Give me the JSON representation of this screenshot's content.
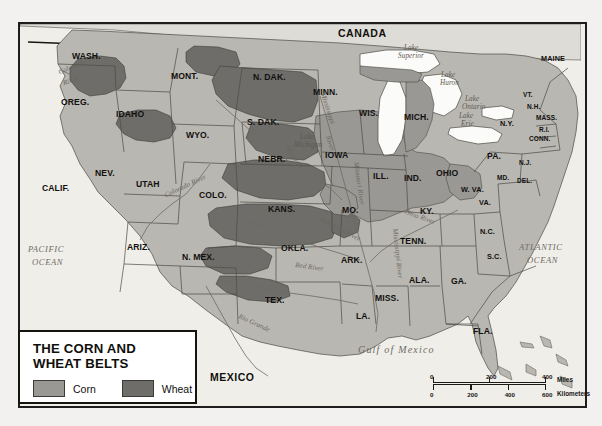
{
  "legend": {
    "title_line1": "THE CORN AND",
    "title_line2": "WHEAT BELTS",
    "corn_label": "Corn",
    "wheat_label": "Wheat",
    "corn_color": "#9a9894",
    "wheat_color": "#6e6d6a"
  },
  "scale": {
    "miles_unit": "Miles",
    "km_unit": "Kilometers",
    "miles_ticks": [
      "0",
      "200",
      "400"
    ],
    "km_ticks": [
      "0",
      "200",
      "400",
      "600"
    ]
  },
  "countries": [
    {
      "name": "CANADA",
      "x": 338,
      "y": 28
    },
    {
      "name": "MEXICO",
      "x": 210,
      "y": 372
    }
  ],
  "oceans": [
    {
      "name": "PACIFIC",
      "x": 28,
      "y": 245,
      "size": "sm"
    },
    {
      "name": "OCEAN",
      "x": 32,
      "y": 258,
      "size": "sm"
    },
    {
      "name": "ATLANTIC",
      "x": 519,
      "y": 243,
      "size": "sm"
    },
    {
      "name": "OCEAN",
      "x": 527,
      "y": 256,
      "size": "sm"
    },
    {
      "name": "Gulf of Mexico",
      "x": 358,
      "y": 345,
      "size": "gulf"
    }
  ],
  "lakes": [
    {
      "name": "Lake",
      "x": 404,
      "y": 45
    },
    {
      "name": "Superior",
      "x": 398,
      "y": 53
    },
    {
      "name": "Lake",
      "x": 441,
      "y": 72
    },
    {
      "name": "Huron",
      "x": 440,
      "y": 80
    },
    {
      "name": "Lake",
      "x": 300,
      "y": 134
    },
    {
      "name": "Michigan",
      "x": 294,
      "y": 142
    },
    {
      "name": "Lake",
      "x": 459,
      "y": 113
    },
    {
      "name": "Erie",
      "x": 461,
      "y": 121
    },
    {
      "name": "Lake",
      "x": 465,
      "y": 96
    },
    {
      "name": "Ontario",
      "x": 462,
      "y": 104
    }
  ],
  "rivers": [
    {
      "name": "Columbia",
      "x": 58,
      "y": 64,
      "rot": -22
    },
    {
      "name": "River",
      "x": 63,
      "y": 78,
      "rot": -18
    },
    {
      "name": "Colorado River",
      "x": 163,
      "y": 183,
      "rot": -25
    },
    {
      "name": "Rio Grande",
      "x": 237,
      "y": 320,
      "rot": 25
    },
    {
      "name": "Mississippi",
      "x": 311,
      "y": 105,
      "rot": 72
    },
    {
      "name": "River",
      "x": 322,
      "y": 140,
      "rot": 72
    },
    {
      "name": "Missouri",
      "x": 281,
      "y": 154,
      "rot": 55
    },
    {
      "name": "Missouri River",
      "x": 337,
      "y": 180,
      "rot": 82
    },
    {
      "name": "Arkansas River",
      "x": 318,
      "y": 226,
      "rot": 28
    },
    {
      "name": "Red River",
      "x": 295,
      "y": 264,
      "rot": 8
    },
    {
      "name": "Mississippi River",
      "x": 372,
      "y": 250,
      "rot": 84
    },
    {
      "name": "Ohio River",
      "x": 404,
      "y": 214,
      "rot": 20
    }
  ],
  "states": [
    {
      "name": "WASH.",
      "x": 72,
      "y": 52,
      "size": ""
    },
    {
      "name": "OREG.",
      "x": 61,
      "y": 98,
      "size": ""
    },
    {
      "name": "IDAHO",
      "x": 116,
      "y": 110,
      "size": ""
    },
    {
      "name": "MONT.",
      "x": 171,
      "y": 72,
      "size": ""
    },
    {
      "name": "WYO.",
      "x": 186,
      "y": 131,
      "size": ""
    },
    {
      "name": "N. DAK.",
      "x": 253,
      "y": 73,
      "size": ""
    },
    {
      "name": "S. DAK.",
      "x": 247,
      "y": 118,
      "size": ""
    },
    {
      "name": "NEBR.",
      "x": 258,
      "y": 155,
      "size": ""
    },
    {
      "name": "KANS.",
      "x": 268,
      "y": 205,
      "size": ""
    },
    {
      "name": "COLO.",
      "x": 199,
      "y": 191,
      "size": ""
    },
    {
      "name": "UTAH",
      "x": 136,
      "y": 180,
      "size": ""
    },
    {
      "name": "NEV.",
      "x": 95,
      "y": 169,
      "size": ""
    },
    {
      "name": "CALIF.",
      "x": 42,
      "y": 184,
      "size": ""
    },
    {
      "name": "ARIZ.",
      "x": 127,
      "y": 243,
      "size": ""
    },
    {
      "name": "N. MEX.",
      "x": 182,
      "y": 253,
      "size": ""
    },
    {
      "name": "TEX.",
      "x": 265,
      "y": 296,
      "size": ""
    },
    {
      "name": "OKLA.",
      "x": 281,
      "y": 244,
      "size": ""
    },
    {
      "name": "MINN.",
      "x": 313,
      "y": 88,
      "size": ""
    },
    {
      "name": "IOWA",
      "x": 325,
      "y": 151,
      "size": ""
    },
    {
      "name": "WIS.",
      "x": 359,
      "y": 109,
      "size": ""
    },
    {
      "name": "MICH.",
      "x": 404,
      "y": 113,
      "size": ""
    },
    {
      "name": "MO.",
      "x": 342,
      "y": 206,
      "size": ""
    },
    {
      "name": "ARK.",
      "x": 341,
      "y": 256,
      "size": ""
    },
    {
      "name": "LA.",
      "x": 356,
      "y": 312,
      "size": ""
    },
    {
      "name": "MISS.",
      "x": 375,
      "y": 294,
      "size": ""
    },
    {
      "name": "ALA.",
      "x": 409,
      "y": 276,
      "size": ""
    },
    {
      "name": "TENN.",
      "x": 400,
      "y": 237,
      "size": ""
    },
    {
      "name": "KY.",
      "x": 420,
      "y": 207,
      "size": ""
    },
    {
      "name": "ILL.",
      "x": 373,
      "y": 172,
      "size": ""
    },
    {
      "name": "IND.",
      "x": 404,
      "y": 174,
      "size": ""
    },
    {
      "name": "OHIO",
      "x": 436,
      "y": 169,
      "size": ""
    },
    {
      "name": "W. VA.",
      "x": 461,
      "y": 186,
      "size": "sm"
    },
    {
      "name": "VA.",
      "x": 479,
      "y": 199,
      "size": "sm"
    },
    {
      "name": "N.C.",
      "x": 480,
      "y": 228,
      "size": "sm"
    },
    {
      "name": "S.C.",
      "x": 487,
      "y": 253,
      "size": "sm"
    },
    {
      "name": "GA.",
      "x": 451,
      "y": 277,
      "size": ""
    },
    {
      "name": "FLA.",
      "x": 473,
      "y": 327,
      "size": ""
    },
    {
      "name": "PA.",
      "x": 487,
      "y": 152,
      "size": ""
    },
    {
      "name": "N.Y.",
      "x": 500,
      "y": 120,
      "size": "sm"
    },
    {
      "name": "MAINE",
      "x": 541,
      "y": 55,
      "size": "sm"
    },
    {
      "name": "VT.",
      "x": 523,
      "y": 92,
      "size": "xs"
    },
    {
      "name": "N.H.",
      "x": 527,
      "y": 104,
      "size": "xs"
    },
    {
      "name": "MASS.",
      "x": 536,
      "y": 115,
      "size": "xs"
    },
    {
      "name": "R.I.",
      "x": 539,
      "y": 127,
      "size": "xs"
    },
    {
      "name": "CONN.",
      "x": 529,
      "y": 136,
      "size": "xs"
    },
    {
      "name": "N.J.",
      "x": 519,
      "y": 160,
      "size": "xs"
    },
    {
      "name": "MD.",
      "x": 497,
      "y": 175,
      "size": "xs"
    },
    {
      "name": "DEL.",
      "x": 517,
      "y": 178,
      "size": "xs"
    }
  ]
}
